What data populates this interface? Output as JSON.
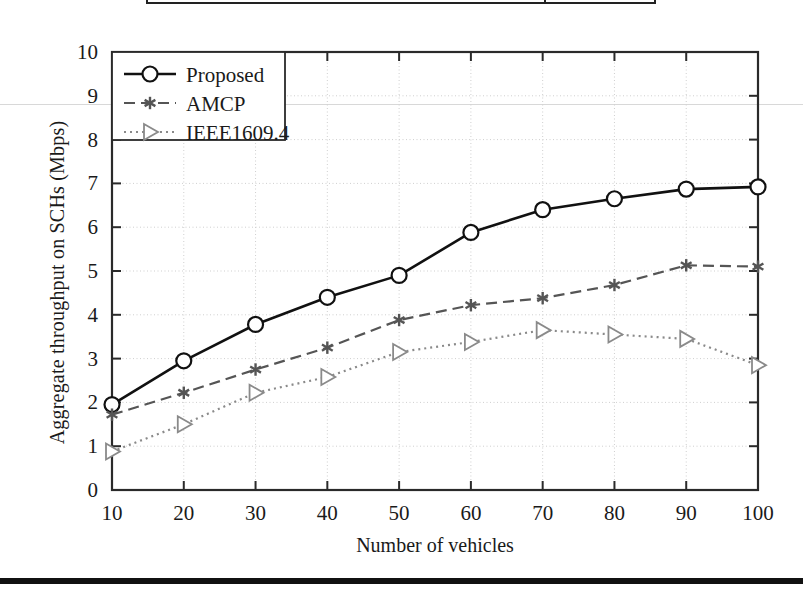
{
  "figure": {
    "x_axis_title": "Number of vehicles",
    "y_axis_title": "Aggregate throughput on SCHs (Mbps)"
  },
  "legend": {
    "entries": [
      {
        "label": "Proposed",
        "marker": "circle-marker",
        "style": "solid"
      },
      {
        "label": "AMCP",
        "marker": "asterisk-marker",
        "style": "dashed"
      },
      {
        "label": "IEEE1609.4",
        "marker": "triangle-marker",
        "style": "dotted"
      }
    ]
  },
  "chart_data": {
    "type": "line",
    "title": "",
    "xlabel": "Number of vehicles",
    "ylabel": "Aggregate throughput on SCHs (Mbps)",
    "x": [
      10,
      20,
      30,
      40,
      50,
      60,
      70,
      80,
      90,
      100
    ],
    "xlim": [
      10,
      100
    ],
    "ylim": [
      0,
      10
    ],
    "xticks": [
      "10",
      "20",
      "30",
      "40",
      "50",
      "60",
      "70",
      "80",
      "90",
      "100"
    ],
    "yticks": [
      "0",
      "1",
      "2",
      "3",
      "4",
      "5",
      "6",
      "7",
      "8",
      "9",
      "10"
    ],
    "grid": true,
    "legend_position": "top-left",
    "series": [
      {
        "name": "Proposed",
        "color": "#111111",
        "linestyle": "solid",
        "marker": "circle",
        "values": [
          1.95,
          2.95,
          3.78,
          4.4,
          4.9,
          5.88,
          6.4,
          6.65,
          6.87,
          6.92
        ]
      },
      {
        "name": "AMCP",
        "color": "#555555",
        "linestyle": "dashed",
        "marker": "asterisk",
        "values": [
          1.72,
          2.22,
          2.75,
          3.25,
          3.88,
          4.22,
          4.38,
          4.68,
          5.13,
          5.1
        ]
      },
      {
        "name": "IEEE1609.4",
        "color": "#8a8a8a",
        "linestyle": "dotted",
        "marker": "triangle",
        "values": [
          0.88,
          1.5,
          2.22,
          2.58,
          3.15,
          3.38,
          3.65,
          3.55,
          3.45,
          2.85
        ]
      }
    ]
  }
}
